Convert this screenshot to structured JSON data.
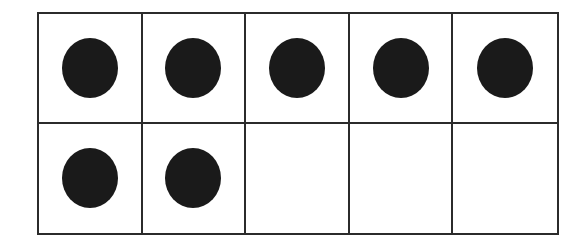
{
  "diagram": {
    "type": "ten-frame",
    "rows": 2,
    "columns": 5,
    "filled_count": 7,
    "total_cells": 10,
    "dot_color": "#1a1a1a",
    "line_color": "#2b2b2b",
    "cells": [
      {
        "filled": true
      },
      {
        "filled": true
      },
      {
        "filled": true
      },
      {
        "filled": true
      },
      {
        "filled": true
      },
      {
        "filled": true
      },
      {
        "filled": true
      },
      {
        "filled": false
      },
      {
        "filled": false
      },
      {
        "filled": false
      }
    ]
  }
}
